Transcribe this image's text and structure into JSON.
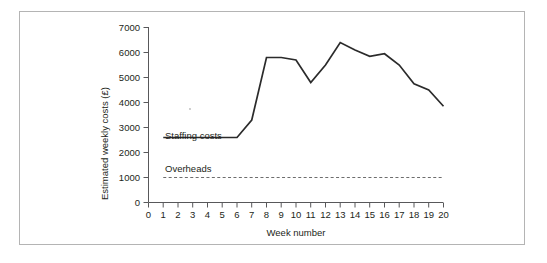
{
  "figure": {
    "border_color": "#b4b4b4",
    "background": "#ffffff"
  },
  "chart_data": {
    "type": "line",
    "title": "",
    "xlabel": "Week number",
    "ylabel": "Estimated weekly costs (£)",
    "xlim": [
      0,
      20
    ],
    "ylim": [
      0,
      7000
    ],
    "grid": false,
    "legend_position": "inline-annotation",
    "x_tick_labels": [
      "0",
      "1",
      "2",
      "3",
      "4",
      "5",
      "6",
      "7",
      "8",
      "9",
      "10",
      "11",
      "12",
      "13",
      "14",
      "15",
      "16",
      "17",
      "18",
      "19",
      "20"
    ],
    "y_tick_labels": [
      "0",
      "1000",
      "2000",
      "3000",
      "4000",
      "5000",
      "6000",
      "7000"
    ],
    "x": [
      1,
      2,
      3,
      4,
      5,
      6,
      7,
      8,
      9,
      10,
      11,
      12,
      13,
      14,
      15,
      16,
      17,
      18,
      19,
      20
    ],
    "series": [
      {
        "name": "Staffing costs",
        "style": "solid",
        "color": "#2b2b2b",
        "values": [
          2600,
          2600,
          2600,
          2600,
          2600,
          2600,
          3300,
          5800,
          5800,
          5700,
          4800,
          5500,
          6400,
          6100,
          5850,
          5950,
          5500,
          4750,
          4500,
          3850
        ]
      },
      {
        "name": "Overheads",
        "style": "dashed",
        "color": "#6d6d6d",
        "constant_value": 1000,
        "values": [
          1000,
          1000,
          1000,
          1000,
          1000,
          1000,
          1000,
          1000,
          1000,
          1000,
          1000,
          1000,
          1000,
          1000,
          1000,
          1000,
          1000,
          1000,
          1000,
          1000
        ]
      }
    ],
    "annotations": [
      {
        "text": "Staffing costs",
        "x": 1.1,
        "y": 2950
      },
      {
        "text": "Overheads",
        "x": 1.1,
        "y": 1450
      }
    ]
  }
}
